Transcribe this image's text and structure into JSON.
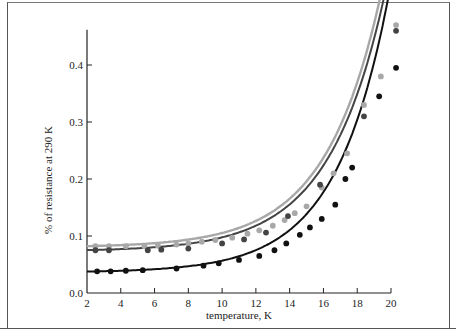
{
  "chart_data": {
    "type": "scatter",
    "title": "",
    "xlabel": "temperature, K",
    "ylabel": "% of resistance at 290 K",
    "xlim": [
      2,
      20.5
    ],
    "ylim": [
      0.0,
      0.46
    ],
    "x_ticks": [
      "2",
      "4",
      "6",
      "8",
      "10",
      "12",
      "14",
      "16",
      "18",
      "20"
    ],
    "y_ticks": [
      "0.0",
      "0.1",
      "0.2",
      "0.3",
      "0.4"
    ],
    "grid": false,
    "legend": "none",
    "series": [
      {
        "name": "upper (light gray)",
        "color": "#a8a8a8",
        "marker": "circle",
        "fit_line": true,
        "x": [
          2.5,
          3.3,
          4.3,
          5.4,
          6.2,
          7.3,
          8.0,
          8.8,
          9.6,
          10.6,
          11.5,
          12.2,
          13.0,
          13.7,
          14.3,
          15.0,
          15.9,
          16.6,
          17.4,
          18.4,
          19.4,
          20.3
        ],
        "y": [
          0.082,
          0.082,
          0.082,
          0.082,
          0.083,
          0.085,
          0.087,
          0.09,
          0.093,
          0.097,
          0.104,
          0.11,
          0.118,
          0.128,
          0.14,
          0.152,
          0.185,
          0.21,
          0.245,
          0.33,
          0.38,
          0.47
        ]
      },
      {
        "name": "middle (dark gray)",
        "color": "#444444",
        "marker": "circle",
        "fit_line": true,
        "x": [
          2.5,
          3.3,
          5.6,
          6.4,
          8.0,
          10.0,
          11.3,
          12.6,
          13.9,
          15.8,
          18.4,
          20.3
        ],
        "y": [
          0.075,
          0.075,
          0.075,
          0.076,
          0.078,
          0.087,
          0.094,
          0.106,
          0.135,
          0.19,
          0.31,
          0.46
        ]
      },
      {
        "name": "lower (black)",
        "color": "#111111",
        "marker": "circle",
        "fit_line": true,
        "x": [
          2.6,
          3.4,
          4.3,
          5.3,
          7.3,
          8.9,
          9.8,
          11.0,
          12.2,
          13.1,
          13.8,
          14.6,
          15.2,
          15.9,
          16.7,
          17.3,
          17.7,
          19.3,
          20.3
        ],
        "y": [
          0.038,
          0.038,
          0.039,
          0.04,
          0.043,
          0.048,
          0.052,
          0.058,
          0.065,
          0.075,
          0.087,
          0.102,
          0.115,
          0.13,
          0.155,
          0.2,
          0.22,
          0.345,
          0.395
        ]
      }
    ]
  }
}
